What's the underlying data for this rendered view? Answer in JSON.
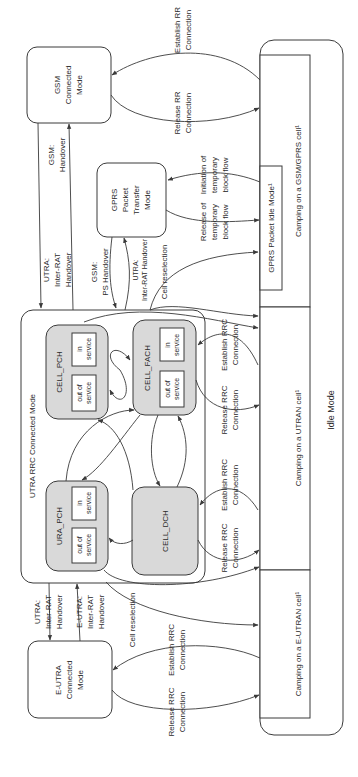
{
  "figure": {
    "orientation": "rotated-90-ccw",
    "colors": {
      "line": "#3a3a3a",
      "state_fill": "#d9d9d9",
      "background": "#ffffff"
    },
    "states": {
      "gsm_connected": [
        "GSM",
        "Connected",
        "Mode"
      ],
      "gprs_transfer": [
        "GPRS",
        "Packet",
        "Transfer",
        "Mode"
      ],
      "eutra_connected": [
        "E-UTRA",
        "Connected",
        "Mode"
      ],
      "utra_rrc": "UTRA RRC Connected Mode",
      "cell_pch": "CELL_PCH",
      "cell_fach": "CELL_FACH",
      "ura_pch": "URA_PCH",
      "cell_dch": "CELL_DCH",
      "out_of_service": [
        "out of",
        "service"
      ],
      "in_service": [
        "in",
        "service"
      ]
    },
    "idle": {
      "title": "Idle Mode",
      "camping_gsm": "Camping on a GSM/GPRS cell¹",
      "gprs_packet_idle": "GPRS Packet Idle Mode¹",
      "camping_utran": "Camping on a UTRAN cell¹",
      "camping_eutran": "Camping on a E-UTRAN cell¹"
    },
    "transitions": {
      "establish_rr": [
        "Establish RR",
        "Connection"
      ],
      "release_rr": [
        "Release RR",
        "Connection"
      ],
      "init_tbf": [
        "Initiation of",
        "temporary",
        "block flow"
      ],
      "release_tbf": [
        "Release of",
        "temporary",
        "block flow"
      ],
      "gsm_handover": [
        "GSM:",
        "Handover"
      ],
      "utra_irat_handover": [
        "UTRA:",
        "Inter-RAT",
        "Handover"
      ],
      "gsm_ps_handover": [
        "GSM:",
        "PS Handover"
      ],
      "utra_irat_handover_2": [
        "UTRA:",
        "Inter-RAT Handover"
      ],
      "cell_reselection": "Cell reselection",
      "establish_rrc": [
        "Establish RRC",
        "Connection"
      ],
      "release_rrc": [
        "Release RRC",
        "Connection"
      ],
      "eutra_irat_handover": [
        "E-UTRA:",
        "Inter-RAT",
        "Handover"
      ]
    }
  }
}
